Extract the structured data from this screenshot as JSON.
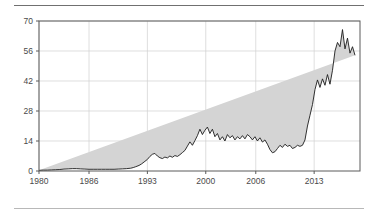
{
  "figure": {
    "top_rule_color": "#707070",
    "bottom_rule_color": "#b8b8b8"
  },
  "chart_data": {
    "type": "area",
    "title": "",
    "subtitle": "",
    "xlabel": "",
    "ylabel": "",
    "grid": true,
    "legend": "none",
    "series_name": "",
    "line_color": "#1c1c1c",
    "fill_color": "#d4d4d4",
    "xlim": [
      1980,
      2018.5
    ],
    "ylim": [
      0,
      70
    ],
    "yticks": [
      0,
      14,
      28,
      42,
      56,
      70
    ],
    "ytick_labels": [
      "0",
      "14",
      "28",
      "42",
      "56",
      "70"
    ],
    "xticks": [
      1980,
      1986,
      1993,
      2000,
      2006,
      2013
    ],
    "xtick_labels": [
      "1980",
      "1986",
      "1993",
      "2000",
      "2006",
      "2013"
    ],
    "x": [
      1980.0,
      1980.5,
      1981.0,
      1981.5,
      1982.0,
      1982.5,
      1983.0,
      1983.5,
      1984.0,
      1984.5,
      1985.0,
      1985.5,
      1986.0,
      1986.5,
      1987.0,
      1987.5,
      1988.0,
      1988.5,
      1989.0,
      1989.5,
      1990.0,
      1990.5,
      1991.0,
      1991.3,
      1991.6,
      1992.0,
      1992.3,
      1992.6,
      1993.0,
      1993.3,
      1993.6,
      1993.9,
      1994.2,
      1994.5,
      1994.8,
      1995.1,
      1995.4,
      1995.7,
      1996.0,
      1996.3,
      1996.6,
      1996.9,
      1997.2,
      1997.5,
      1997.8,
      1998.1,
      1998.4,
      1998.7,
      1999.0,
      1999.3,
      1999.6,
      1999.9,
      2000.2,
      2000.5,
      2000.8,
      2001.1,
      2001.4,
      2001.7,
      2002.0,
      2002.3,
      2002.6,
      2002.9,
      2003.2,
      2003.5,
      2003.8,
      2004.1,
      2004.4,
      2004.7,
      2005.0,
      2005.3,
      2005.6,
      2005.9,
      2006.2,
      2006.5,
      2006.8,
      2007.1,
      2007.4,
      2007.7,
      2008.0,
      2008.3,
      2008.6,
      2008.9,
      2009.2,
      2009.5,
      2009.8,
      2010.1,
      2010.4,
      2010.7,
      2011.0,
      2011.3,
      2011.6,
      2011.9,
      2012.2,
      2012.5,
      2012.8,
      2013.1,
      2013.4,
      2013.7,
      2014.0,
      2014.3,
      2014.6,
      2014.9,
      2015.2,
      2015.5,
      2015.8,
      2016.1,
      2016.4,
      2016.7,
      2017.0,
      2017.3,
      2017.6,
      2017.9,
      2018.2,
      2018.5
    ],
    "y": [
      0.3,
      0.4,
      0.4,
      0.5,
      0.6,
      0.7,
      0.9,
      1.0,
      1.1,
      1.1,
      1.0,
      0.9,
      0.8,
      0.8,
      0.8,
      0.8,
      0.8,
      0.8,
      0.8,
      0.9,
      1.0,
      1.1,
      1.3,
      1.6,
      2.0,
      2.6,
      3.3,
      4.2,
      5.4,
      6.8,
      7.8,
      8.2,
      7.0,
      6.2,
      5.8,
      6.5,
      6.1,
      7.0,
      6.4,
      7.2,
      6.8,
      7.6,
      8.6,
      9.6,
      11.6,
      13.6,
      12.0,
      14.2,
      16.5,
      19.5,
      17.0,
      19.0,
      20.5,
      17.5,
      19.5,
      16.0,
      17.5,
      14.5,
      16.0,
      14.0,
      17.0,
      15.5,
      16.5,
      14.5,
      16.0,
      15.0,
      16.5,
      15.0,
      17.0,
      16.0,
      14.5,
      16.0,
      14.0,
      15.5,
      13.5,
      14.5,
      12.5,
      10.0,
      8.5,
      9.0,
      10.5,
      12.0,
      11.0,
      12.5,
      11.5,
      12.0,
      10.5,
      11.0,
      12.0,
      11.5,
      12.0,
      14.5,
      21.0,
      26.0,
      31.0,
      38.0,
      42.5,
      39.0,
      43.0,
      40.0,
      45.0,
      40.5,
      47.0,
      56.0,
      60.0,
      58.0,
      66.0,
      57.0,
      62.0,
      55.0,
      58.0,
      54.0
    ]
  }
}
